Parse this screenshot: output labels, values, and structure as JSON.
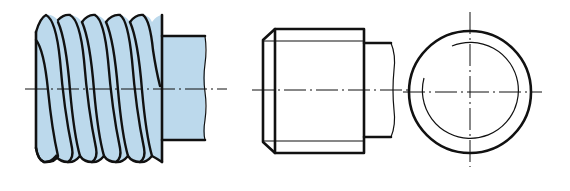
{
  "figure": {
    "views": [
      {
        "id": "pictorial",
        "label": "Thread representation (pictorial, shaded)"
      },
      {
        "id": "side",
        "label": "Side view (conventional thread representation)"
      },
      {
        "id": "end",
        "label": "End view (thread root shown as 3/4 circle)"
      }
    ]
  },
  "colors": {
    "fill": "#bcd9ec",
    "line": "#111111",
    "background": "#ffffff"
  }
}
